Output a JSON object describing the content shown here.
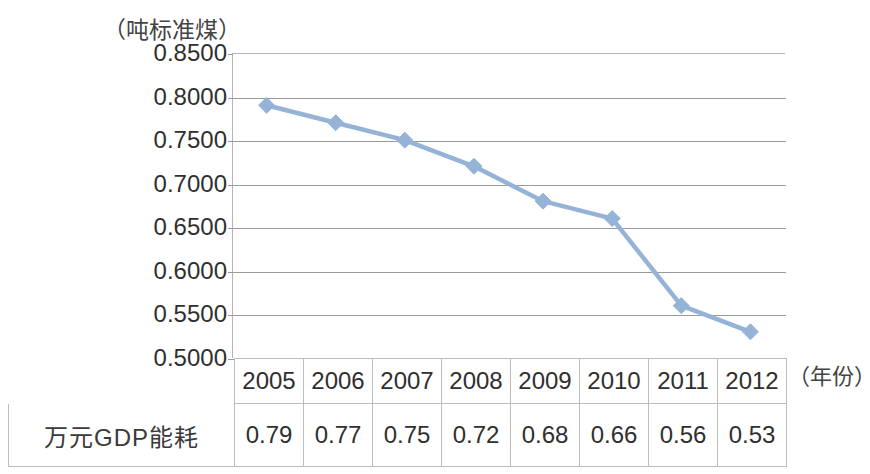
{
  "chart_data": {
    "type": "line",
    "title": "",
    "subtitle": "",
    "xlabel": "（年份）",
    "ylabel": "（吨标准煤）",
    "categories": [
      "2005",
      "2006",
      "2007",
      "2008",
      "2009",
      "2010",
      "2011",
      "2012"
    ],
    "series": [
      {
        "name": "万元GDP能耗",
        "values": [
          0.79,
          0.77,
          0.75,
          0.72,
          0.68,
          0.66,
          0.56,
          0.53
        ]
      }
    ],
    "ylim": [
      0.5,
      0.85
    ],
    "ytick_labels": [
      "0.8500",
      "0.8000",
      "0.7500",
      "0.7000",
      "0.6500",
      "0.6000",
      "0.5500",
      "0.5000"
    ],
    "ytick_values": [
      0.85,
      0.8,
      0.75,
      0.7,
      0.65,
      0.6,
      0.55,
      0.5
    ],
    "grid": true,
    "legend": "none",
    "marker": "diamond",
    "series_color": "#95B3D7",
    "gridline_color": "#9A9A9A",
    "axis_color": "#B4B4B4"
  },
  "table": {
    "row_label": "万元GDP能耗",
    "columns": [
      "2005",
      "2006",
      "2007",
      "2008",
      "2009",
      "2010",
      "2011",
      "2012"
    ],
    "values": [
      "0.79",
      "0.77",
      "0.75",
      "0.72",
      "0.68",
      "0.66",
      "0.56",
      "0.53"
    ]
  }
}
